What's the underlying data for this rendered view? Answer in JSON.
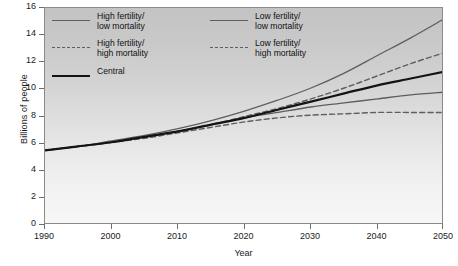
{
  "chart_data": {
    "type": "line",
    "title": "",
    "xlabel": "Year",
    "ylabel": "Billions of people",
    "xlim": [
      1990,
      2050
    ],
    "ylim": [
      0,
      16
    ],
    "xticks": [
      1990,
      2000,
      2010,
      2020,
      2030,
      2040,
      2050
    ],
    "yticks": [
      0,
      2,
      4,
      6,
      8,
      10,
      12,
      14,
      16
    ],
    "grid": false,
    "legend_position": "top-left",
    "x": [
      1990,
      1995,
      2000,
      2005,
      2010,
      2015,
      2020,
      2025,
      2030,
      2035,
      2040,
      2045,
      2050
    ],
    "series": [
      {
        "name": "High fertility/ low mortality",
        "style": "solid",
        "color": "#5e5e5e",
        "width": 1.3,
        "values": [
          5.5,
          5.8,
          6.2,
          6.6,
          7.1,
          7.7,
          8.4,
          9.2,
          10.1,
          11.2,
          12.5,
          13.8,
          15.2
        ]
      },
      {
        "name": "Low fertility/ low mortality",
        "style": "solid",
        "color": "#5e5e5e",
        "width": 1.3,
        "values": [
          5.5,
          5.8,
          6.1,
          6.5,
          6.9,
          7.4,
          7.9,
          8.3,
          8.7,
          9.0,
          9.3,
          9.6,
          9.8
        ]
      },
      {
        "name": "High fertility/ high mortality",
        "style": "dashed",
        "color": "#5e5e5e",
        "width": 1.4,
        "values": [
          5.5,
          5.8,
          6.1,
          6.5,
          6.9,
          7.4,
          8.0,
          8.6,
          9.3,
          10.1,
          11.0,
          11.9,
          12.7
        ]
      },
      {
        "name": "Low fertility/ high mortality",
        "style": "dashed",
        "color": "#5e5e5e",
        "width": 1.4,
        "values": [
          5.5,
          5.8,
          6.1,
          6.4,
          6.8,
          7.2,
          7.6,
          7.9,
          8.1,
          8.2,
          8.3,
          8.3,
          8.3
        ]
      },
      {
        "name": "Central",
        "style": "solid",
        "color": "#141414",
        "width": 2.2,
        "values": [
          5.5,
          5.8,
          6.1,
          6.5,
          6.9,
          7.4,
          7.9,
          8.5,
          9.1,
          9.7,
          10.3,
          10.8,
          11.3
        ]
      }
    ]
  },
  "axes": {
    "ylabel": "Billions of people",
    "xlabel": "Year",
    "xticks": [
      "1990",
      "2000",
      "2010",
      "2020",
      "2030",
      "2040",
      "2050"
    ],
    "yticks": [
      "16",
      "14",
      "12",
      "10",
      "8",
      "6",
      "4",
      "2",
      "0"
    ]
  },
  "legend": {
    "left": [
      {
        "label": "High fertility/\nlow mortality",
        "swatch": "solid-gray"
      },
      {
        "label": "High fertility/\nhigh mortality",
        "swatch": "dash-gray"
      },
      {
        "label": "Central",
        "swatch": "solid-black"
      }
    ],
    "right": [
      {
        "label": "Low fertility/\nlow mortality",
        "swatch": "solid-gray"
      },
      {
        "label": "Low fertility/\nhigh mortality",
        "swatch": "dash-gray"
      }
    ]
  }
}
